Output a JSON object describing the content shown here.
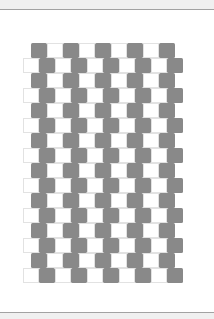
{
  "illusion": {
    "type": "cafe-wall",
    "rows": 16,
    "row_height": 15,
    "cell_width": 16,
    "top": 43,
    "odd_row": {
      "left": 31,
      "cells": 9,
      "starts_with": "gray"
    },
    "even_row": {
      "left": 23,
      "cells": 10,
      "starts_with": "white"
    }
  },
  "colors": {
    "tile_dark": "#898989",
    "tile_light": "#ffffff",
    "frame_line": "#a2a2a2",
    "frame_bg": "#f0f0f0"
  }
}
